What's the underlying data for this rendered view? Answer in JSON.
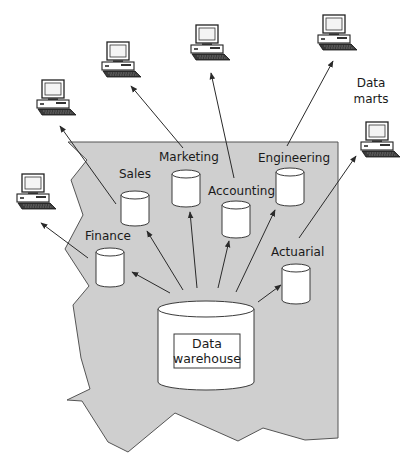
{
  "diagram": {
    "warehouse": {
      "label_line1": "Data",
      "label_line2": "warehouse",
      "icon": "database-cylinder-icon"
    },
    "data_marts": [
      {
        "id": "sales",
        "label": "Sales",
        "icon": "database-cylinder-icon"
      },
      {
        "id": "marketing",
        "label": "Marketing",
        "icon": "database-cylinder-icon"
      },
      {
        "id": "accounting",
        "label": "Accounting",
        "icon": "database-cylinder-icon"
      },
      {
        "id": "engineering",
        "label": "Engineering",
        "icon": "database-cylinder-icon"
      },
      {
        "id": "finance",
        "label": "Finance",
        "icon": "database-cylinder-icon"
      },
      {
        "id": "actuarial",
        "label": "Actuarial",
        "icon": "database-cylinder-icon"
      }
    ],
    "data_marts_caption_line1": "Data",
    "data_marts_caption_line2": "marts",
    "workstations": [
      {
        "id": "finance",
        "icon": "desktop-computer-icon"
      },
      {
        "id": "sales",
        "icon": "desktop-computer-icon"
      },
      {
        "id": "marketing",
        "icon": "desktop-computer-icon"
      },
      {
        "id": "accounting",
        "icon": "desktop-computer-icon"
      },
      {
        "id": "engineering",
        "icon": "desktop-computer-icon"
      },
      {
        "id": "actuarial",
        "icon": "desktop-computer-icon"
      }
    ],
    "colors": {
      "region_fill": "#cfcfcf",
      "region_stroke": "#555555",
      "line": "#2a2a2a"
    }
  }
}
